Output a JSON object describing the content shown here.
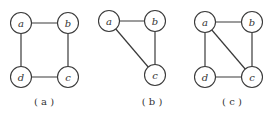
{
  "figures": [
    {
      "caption": "( a )",
      "nodes": {
        "a": "a",
        "b": "b",
        "c": "c",
        "d": "d"
      },
      "edges": [
        [
          "a",
          "b"
        ],
        [
          "b",
          "c"
        ],
        [
          "c",
          "d"
        ],
        [
          "d",
          "a"
        ]
      ]
    },
    {
      "caption": "( b )",
      "nodes": {
        "a": "a",
        "b": "b",
        "c": "c"
      },
      "edges": [
        [
          "a",
          "b"
        ],
        [
          "b",
          "c"
        ],
        [
          "a",
          "c"
        ]
      ]
    },
    {
      "caption": "( c )",
      "nodes": {
        "a": "a",
        "b": "b",
        "c": "c",
        "d": "d"
      },
      "edges": [
        [
          "a",
          "b"
        ],
        [
          "b",
          "c"
        ],
        [
          "c",
          "d"
        ],
        [
          "d",
          "a"
        ],
        [
          "a",
          "c"
        ]
      ]
    }
  ],
  "colors": {
    "stroke": "#3a3a3a",
    "text": "#333333",
    "background": "#ffffff"
  }
}
